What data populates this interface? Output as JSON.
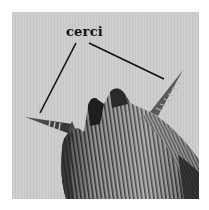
{
  "figure": {
    "label": "cerci",
    "annotations": [
      {
        "name": "left-cercus-leader",
        "target": "left cercus"
      },
      {
        "name": "right-cercus-leader",
        "target": "right cercus"
      }
    ],
    "colors": {
      "background": "#cfcfcf",
      "label": "#111111",
      "leader_line": "#111111",
      "body_dark": "#2a2a2a",
      "body_mid": "#7a7a7a"
    }
  }
}
